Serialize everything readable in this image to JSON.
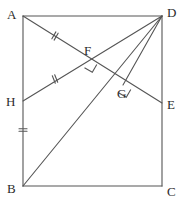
{
  "figure": {
    "type": "geometry-diagram",
    "stroke_color": "#555555",
    "label_color": "#2b2b2b",
    "background_color": "#ffffff",
    "canvas": {
      "width": 189,
      "height": 203
    }
  },
  "points": [
    {
      "id": "A",
      "label": "A",
      "x": 23,
      "y": 16,
      "label_x": 7,
      "label_y": 8
    },
    {
      "id": "B",
      "label": "B",
      "x": 23,
      "y": 186,
      "label_x": 7,
      "label_y": 182
    },
    {
      "id": "C",
      "label": "C",
      "x": 162,
      "y": 186,
      "label_x": 167,
      "label_y": 185
    },
    {
      "id": "D",
      "label": "D",
      "x": 162,
      "y": 16,
      "label_x": 167,
      "label_y": 6
    },
    {
      "id": "E",
      "label": "E",
      "x": 162,
      "y": 103,
      "label_x": 167,
      "label_y": 98
    },
    {
      "id": "F",
      "label": "F",
      "x": 89,
      "y": 60,
      "label_x": 84,
      "label_y": 44
    },
    {
      "id": "G",
      "label": "G",
      "x": 123,
      "y": 85,
      "label_x": 117,
      "label_y": 87
    },
    {
      "id": "H",
      "label": "H",
      "x": 23,
      "y": 101,
      "label_x": 6,
      "label_y": 95
    }
  ],
  "segments": [
    {
      "name": "side-AD",
      "from": "A",
      "to": "D"
    },
    {
      "name": "side-AB",
      "from": "A",
      "to": "B"
    },
    {
      "name": "side-BC",
      "from": "B",
      "to": "C"
    },
    {
      "name": "side-DC",
      "from": "D",
      "to": "C"
    },
    {
      "name": "cevian-AE",
      "from": "A",
      "to": "E"
    },
    {
      "name": "cevian-HD",
      "from": "H",
      "to": "D"
    },
    {
      "name": "diagonal-BD",
      "from": "B",
      "to": "D"
    },
    {
      "name": "perpendicular-DG",
      "from": "D",
      "to": "G"
    }
  ],
  "tick_marks": [
    {
      "name": "tick-AF",
      "x": 55,
      "y": 36,
      "angle": 30,
      "count": 2
    },
    {
      "name": "tick-HF",
      "x": 55,
      "y": 79,
      "angle": -22,
      "count": 2
    },
    {
      "name": "tick-AB",
      "x": 23,
      "y": 130,
      "angle": 90,
      "count": 2
    }
  ],
  "right_angles": [
    {
      "name": "right-angle-at-F",
      "x": 89,
      "y": 60,
      "angle": 30,
      "size": 9
    },
    {
      "name": "right-angle-at-G",
      "x": 123,
      "y": 85,
      "angle": 30,
      "size": 9
    }
  ]
}
